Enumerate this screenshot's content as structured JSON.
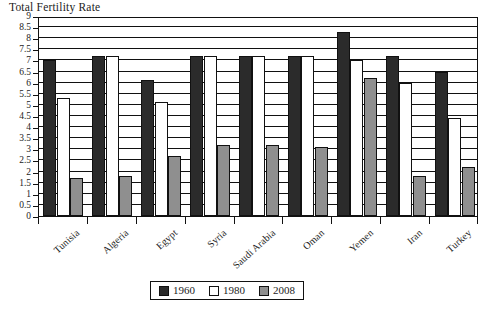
{
  "chart_data": {
    "type": "bar",
    "title": "Total Fertility Rate",
    "xlabel": "",
    "ylabel": "",
    "ylim": [
      0,
      9
    ],
    "ytick_step": 0.5,
    "yticks": [
      "9",
      "8.5",
      "8",
      "7.5",
      "7",
      "6.5",
      "6",
      "5.5",
      "5",
      "4.5",
      "4",
      "3.5",
      "3",
      "2.5",
      "2",
      "1.5",
      "1",
      "0.5",
      "0"
    ],
    "grid": true,
    "legend_position": "bottom-center",
    "categories": [
      "Tunisia",
      "Algeria",
      "Egypt",
      "Syria",
      "Saudi Arabia",
      "Oman",
      "Yemen",
      "Iran",
      "Turkey"
    ],
    "series": [
      {
        "name": "1960",
        "color": "#2b2b2b",
        "values": [
          7.0,
          7.2,
          6.1,
          7.2,
          7.2,
          7.2,
          8.3,
          7.2,
          6.5
        ]
      },
      {
        "name": "1980",
        "color": "#ffffff",
        "values": [
          5.3,
          7.2,
          5.15,
          7.2,
          7.2,
          7.2,
          7.0,
          6.0,
          4.4
        ]
      },
      {
        "name": "2008",
        "color": "#8f8f8f",
        "values": [
          1.7,
          1.8,
          2.7,
          3.2,
          3.2,
          3.1,
          6.2,
          1.8,
          2.2
        ]
      }
    ]
  }
}
